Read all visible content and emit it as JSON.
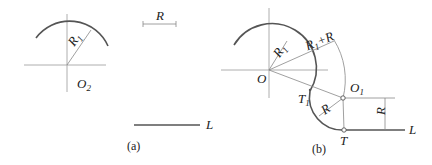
{
  "figure_a": {
    "center_label": "O",
    "center_sub": "2",
    "radius_label": "R",
    "radius_sub": "1",
    "given_radius_label": "R",
    "line_label": "L",
    "caption": "(a)"
  },
  "figure_b": {
    "center_label": "O",
    "radius1_label": "R",
    "radius1_sub": "1",
    "sum_label_a": "R",
    "sum_label_sub": "1",
    "sum_label_b": "+R",
    "tangent1_label": "T",
    "tangent1_sub": "1",
    "center2_label": "O",
    "center2_sub": "1",
    "arc_radius_label": "R",
    "dim_label": "R",
    "tangent_label": "T",
    "line_label": "L",
    "caption": "(b)"
  },
  "colors": {
    "line": "#555555",
    "thin": "#888888",
    "text": "#222222"
  }
}
